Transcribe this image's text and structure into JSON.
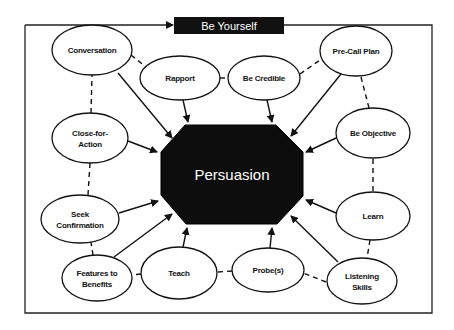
{
  "diagram": {
    "title_banner": {
      "label": "Be Yourself",
      "x": 174,
      "y": 17,
      "w": 110,
      "h": 17
    },
    "frame": {
      "left": 25,
      "top": 25,
      "right": 432,
      "bottom": 313
    },
    "center": {
      "label": "Persuasion",
      "points": [
        [
          185,
          125
        ],
        [
          276,
          125
        ],
        [
          303,
          152
        ],
        [
          303,
          196
        ],
        [
          277,
          224
        ],
        [
          186,
          224
        ],
        [
          161,
          195
        ],
        [
          161,
          152
        ]
      ],
      "cx": 232,
      "cy": 175
    },
    "colors": {
      "line": "#111111",
      "fill_center": "#0d0d0d",
      "node_fill": "#ffffff"
    },
    "nodes": [
      {
        "id": "conversation",
        "lines": [
          "Conversation"
        ],
        "cx": 92,
        "cy": 50,
        "rx": 40,
        "ry": 25
      },
      {
        "id": "rapport",
        "lines": [
          "Rapport"
        ],
        "cx": 180,
        "cy": 78,
        "rx": 40,
        "ry": 22
      },
      {
        "id": "be-credible",
        "lines": [
          "Be Credible"
        ],
        "cx": 264,
        "cy": 78,
        "rx": 36,
        "ry": 22
      },
      {
        "id": "pre-call-plan",
        "lines": [
          "Pre-Call Plan"
        ],
        "cx": 356,
        "cy": 51,
        "rx": 36,
        "ry": 25
      },
      {
        "id": "close-for-action",
        "lines": [
          "Close-for-",
          "Action"
        ],
        "cx": 90,
        "cy": 138,
        "rx": 38,
        "ry": 25
      },
      {
        "id": "be-objective",
        "lines": [
          "Be Objective"
        ],
        "cx": 373,
        "cy": 133,
        "rx": 37,
        "ry": 25
      },
      {
        "id": "seek-confirmation",
        "lines": [
          "Seek",
          "Confirmation"
        ],
        "cx": 80,
        "cy": 219,
        "rx": 39,
        "ry": 24
      },
      {
        "id": "learn",
        "lines": [
          "Learn"
        ],
        "cx": 373,
        "cy": 216,
        "rx": 37,
        "ry": 24
      },
      {
        "id": "features-to-benefits",
        "lines": [
          "Features to",
          "Benefits"
        ],
        "cx": 97,
        "cy": 278,
        "rx": 35,
        "ry": 23
      },
      {
        "id": "teach",
        "lines": [
          "Teach"
        ],
        "cx": 179,
        "cy": 273,
        "rx": 38,
        "ry": 26
      },
      {
        "id": "probes",
        "lines": [
          "Probe(s)"
        ],
        "cx": 268,
        "cy": 270,
        "rx": 36,
        "ry": 22
      },
      {
        "id": "listening-skills",
        "lines": [
          "Listening",
          "Skills"
        ],
        "cx": 362,
        "cy": 281,
        "rx": 35,
        "ry": 23
      }
    ],
    "arrows": [
      {
        "from": "conversation",
        "x1": 118,
        "y1": 73,
        "x2": 172,
        "y2": 138
      },
      {
        "from": "rapport",
        "x1": 183,
        "y1": 100,
        "x2": 188,
        "y2": 122
      },
      {
        "from": "be-credible",
        "x1": 267,
        "y1": 100,
        "x2": 272,
        "y2": 122
      },
      {
        "from": "pre-call-plan",
        "x1": 341,
        "y1": 74,
        "x2": 291,
        "y2": 136
      },
      {
        "from": "close-for-action",
        "x1": 128,
        "y1": 141,
        "x2": 157,
        "y2": 152
      },
      {
        "from": "be-objective",
        "x1": 336,
        "y1": 138,
        "x2": 306,
        "y2": 152
      },
      {
        "from": "seek-confirmation",
        "x1": 119,
        "y1": 213,
        "x2": 158,
        "y2": 201
      },
      {
        "from": "features-to-benefits",
        "x1": 114,
        "y1": 257,
        "x2": 172,
        "y2": 214
      },
      {
        "from": "teach",
        "x1": 183,
        "y1": 247,
        "x2": 187,
        "y2": 228
      },
      {
        "from": "probes",
        "x1": 270,
        "y1": 248,
        "x2": 272,
        "y2": 228
      },
      {
        "from": "learn",
        "x1": 336,
        "y1": 213,
        "x2": 306,
        "y2": 200
      },
      {
        "from": "listening-skills",
        "x1": 338,
        "y1": 262,
        "x2": 291,
        "y2": 216
      }
    ],
    "dashed_links": [
      {
        "from": "conversation",
        "to": "rapport",
        "x1": 131,
        "y1": 55,
        "x2": 146,
        "y2": 67
      },
      {
        "from": "rapport",
        "to": "be-credible",
        "x1": 220,
        "y1": 78,
        "x2": 228,
        "y2": 78
      },
      {
        "from": "be-credible",
        "to": "pre-call-plan",
        "x1": 300,
        "y1": 74,
        "x2": 320,
        "y2": 60
      },
      {
        "from": "pre-call-plan",
        "to": "be-objective",
        "x1": 361,
        "y1": 77,
        "x2": 369,
        "y2": 108
      },
      {
        "from": "be-objective",
        "to": "learn",
        "x1": 373,
        "y1": 159,
        "x2": 373,
        "y2": 192
      },
      {
        "from": "learn",
        "to": "listening-skills",
        "x1": 370,
        "y1": 240,
        "x2": 367,
        "y2": 258
      },
      {
        "from": "listening-skills",
        "to": "probes",
        "x1": 326,
        "y1": 282,
        "x2": 303,
        "y2": 273
      },
      {
        "from": "probes",
        "to": "teach",
        "x1": 232,
        "y1": 271,
        "x2": 217,
        "y2": 272
      },
      {
        "from": "teach",
        "to": "features-to-benefits",
        "x1": 141,
        "y1": 274,
        "x2": 132,
        "y2": 275
      },
      {
        "from": "features-to-benefits",
        "to": "seek-confirmation",
        "x1": 93,
        "y1": 255,
        "x2": 91,
        "y2": 242
      },
      {
        "from": "seek-confirmation",
        "to": "close-for-action",
        "x1": 88,
        "y1": 195,
        "x2": 90,
        "y2": 163
      },
      {
        "from": "close-for-action",
        "to": "conversation",
        "x1": 91,
        "y1": 113,
        "x2": 92,
        "y2": 75
      }
    ]
  }
}
